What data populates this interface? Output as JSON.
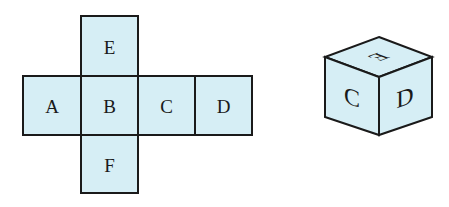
{
  "net": {
    "faces": [
      {
        "id": "E",
        "label": "E",
        "x": 81,
        "y": 16,
        "w": 57,
        "h": 60
      },
      {
        "id": "A",
        "label": "A",
        "x": 23,
        "y": 76,
        "w": 58,
        "h": 59
      },
      {
        "id": "B",
        "label": "B",
        "x": 81,
        "y": 76,
        "w": 57,
        "h": 59
      },
      {
        "id": "C",
        "label": "C",
        "x": 138,
        "y": 76,
        "w": 57,
        "h": 59
      },
      {
        "id": "D",
        "label": "D",
        "x": 195,
        "y": 76,
        "w": 57,
        "h": 59
      },
      {
        "id": "F",
        "label": "F",
        "x": 81,
        "y": 135,
        "w": 57,
        "h": 58
      }
    ]
  },
  "cube": {
    "top_label": "E",
    "left_label": "C",
    "right_label": "D"
  },
  "colors": {
    "face_fill": "#d6eef5",
    "stroke": "#1a1a1a"
  }
}
